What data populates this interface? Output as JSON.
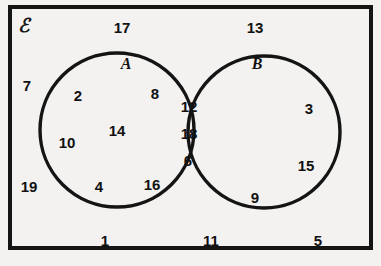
{
  "diagram": {
    "universal_set_symbol": "ℰ",
    "stroke_color": "#141414",
    "background_color": "#f3f2f0",
    "text_color": "#111111",
    "rectangle": {
      "label": "universal-set-rectangle",
      "x": 8,
      "y": 5,
      "width": 365,
      "height": 245,
      "stroke_width": 4
    },
    "circles": [
      {
        "name": "A",
        "label": "A",
        "cx": 117,
        "cy": 130,
        "r": 77,
        "stroke_width": 3.4
      },
      {
        "name": "B",
        "label": "B",
        "cx": 264,
        "cy": 132,
        "r": 76,
        "stroke_width": 3.4
      }
    ],
    "set_labels": [
      {
        "text": "A",
        "x": 126,
        "y": 64
      },
      {
        "text": "B",
        "x": 257,
        "y": 64
      }
    ],
    "regions": {
      "a_only": {
        "name": "A only",
        "values": [
          2,
          8,
          10,
          14,
          4,
          16
        ],
        "items": [
          {
            "value": "2",
            "x": 78,
            "y": 95
          },
          {
            "value": "8",
            "x": 155,
            "y": 93
          },
          {
            "value": "10",
            "x": 67,
            "y": 142
          },
          {
            "value": "14",
            "x": 117,
            "y": 130
          },
          {
            "value": "4",
            "x": 99,
            "y": 186
          },
          {
            "value": "16",
            "x": 152,
            "y": 184
          }
        ]
      },
      "intersection": {
        "name": "A and B",
        "values": [
          12,
          18,
          6
        ],
        "items": [
          {
            "value": "12",
            "x": 189,
            "y": 106
          },
          {
            "value": "18",
            "x": 189,
            "y": 133
          },
          {
            "value": "6",
            "x": 188,
            "y": 160
          }
        ]
      },
      "b_only": {
        "name": "B only",
        "values": [
          3,
          15,
          9
        ],
        "items": [
          {
            "value": "3",
            "x": 309,
            "y": 108
          },
          {
            "value": "15",
            "x": 306,
            "y": 165
          },
          {
            "value": "9",
            "x": 255,
            "y": 197
          }
        ]
      },
      "outside": {
        "name": "Outside both sets",
        "values": [
          17,
          13,
          7,
          19,
          1,
          11,
          5
        ],
        "items": [
          {
            "value": "17",
            "x": 122,
            "y": 27
          },
          {
            "value": "13",
            "x": 255,
            "y": 27
          },
          {
            "value": "7",
            "x": 27,
            "y": 85
          },
          {
            "value": "19",
            "x": 29,
            "y": 186
          },
          {
            "value": "1",
            "x": 105,
            "y": 240
          },
          {
            "value": "11",
            "x": 211,
            "y": 240
          },
          {
            "value": "5",
            "x": 318,
            "y": 240
          }
        ]
      }
    },
    "universe_symbol_position": {
      "x": 24,
      "y": 25
    }
  }
}
